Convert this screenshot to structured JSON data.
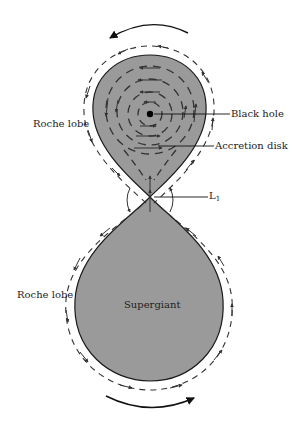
{
  "diagram": {
    "colors": {
      "background": "#ffffff",
      "lobe_fill": "#9a9a9a",
      "outline": "#1a1a1a",
      "arrows": "#333333"
    },
    "labels": {
      "roche_lobe_top": "Roche lobe",
      "roche_lobe_bottom": "Roche lobe",
      "black_hole": "Black hole",
      "accretion_disk": "Accretion disk",
      "l1_main": "L",
      "l1_sub": "1",
      "supergiant": "Supergiant"
    },
    "nodes": [
      {
        "id": "black_hole",
        "label": "Black hole",
        "x": 150,
        "y": 114
      },
      {
        "id": "accretion_disk",
        "label": "Accretion disk"
      },
      {
        "id": "l1",
        "label": "L1",
        "x": 150,
        "y": 197
      },
      {
        "id": "supergiant",
        "label": "Supergiant"
      },
      {
        "id": "roche_lobe_upper",
        "label": "Roche lobe"
      },
      {
        "id": "roche_lobe_lower",
        "label": "Roche lobe"
      }
    ],
    "rotation_arrows": [
      {
        "position": "top",
        "direction": "counterclockwise"
      },
      {
        "position": "bottom",
        "direction": "counterclockwise"
      }
    ]
  }
}
